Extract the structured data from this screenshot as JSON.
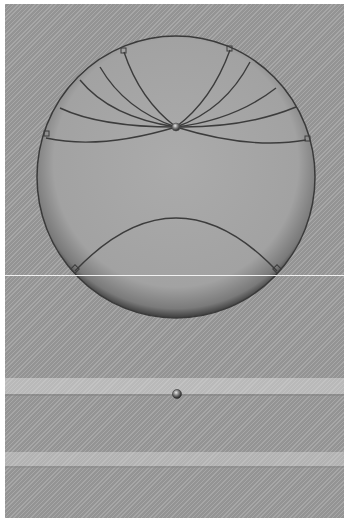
{
  "image": {
    "description": "Grayscale photograph of a translucent spherical droplet/ball with curved arc lines converging on a bright point near the top, one lower arc, and a small dark sphere below on a striped background",
    "colors": {
      "background": "#9d9d9d",
      "sphere_fill": "#a9a9a9",
      "sphere_edge": "#4a4a4a",
      "arc_line": "#3c3c3c",
      "highlight_line": "#f0f0f0",
      "light_band": "#c8c8c8"
    },
    "features": {
      "sphere": {
        "cx": 176,
        "cy": 176,
        "r": 140
      },
      "convergence_point": {
        "x": 176,
        "y": 127
      },
      "small_ball": {
        "x": 177,
        "y": 394
      },
      "horizontal_line_y": 275,
      "upper_arc_count": 8,
      "lower_arc_count": 1,
      "square_markers": 10
    }
  }
}
